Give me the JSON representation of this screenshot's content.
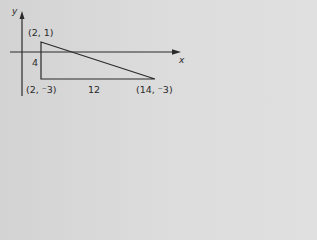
{
  "diagram": {
    "type": "coordinate-triangle",
    "axes": {
      "x_label": "x",
      "y_label": "y"
    },
    "vertices": [
      {
        "name": "top",
        "coords": [
          2,
          1
        ],
        "label": "(2, 1)"
      },
      {
        "name": "right-angle",
        "coords": [
          2,
          -3
        ],
        "label": "(2, ⁻3)"
      },
      {
        "name": "far",
        "coords": [
          14,
          -3
        ],
        "label": "(14, ⁻3)"
      }
    ],
    "side_lengths": {
      "vertical": "4",
      "horizontal": "12"
    },
    "colors": {
      "background": "#d8d8d8",
      "stroke": "#2a2a2a"
    }
  }
}
